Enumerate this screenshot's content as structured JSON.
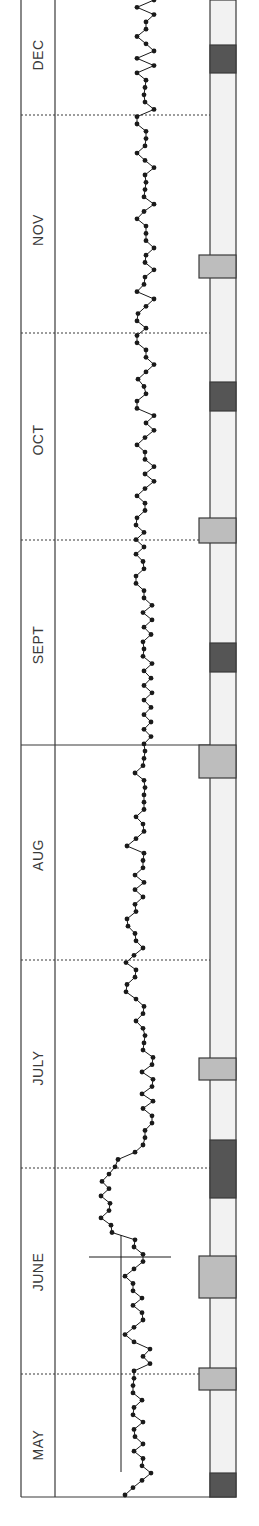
{
  "chart_data": {
    "type": "line",
    "orientation": "rotated-90-ccw",
    "title": "",
    "xlabel": "",
    "ylabel": "",
    "months": [
      {
        "label": "MAY",
        "y_top": 1374,
        "y_bottom": 1497,
        "label_y": 1445
      },
      {
        "label": "JUNE",
        "y_top": 1168,
        "y_bottom": 1374,
        "label_y": 1272
      },
      {
        "label": "JULY",
        "y_top": 960,
        "y_bottom": 1168,
        "label_y": 1068
      },
      {
        "label": "AUG",
        "y_top": 745,
        "y_bottom": 960,
        "label_y": 855
      },
      {
        "label": "SEPT",
        "y_top": 540,
        "y_bottom": 745,
        "label_y": 645
      },
      {
        "label": "OCT",
        "y_top": 333,
        "y_bottom": 540,
        "label_y": 440
      },
      {
        "label": "NOV",
        "y_top": 115,
        "y_bottom": 333,
        "label_y": 230
      },
      {
        "label": "DEC",
        "y_top": 0,
        "y_bottom": 115,
        "label_y": 55
      }
    ],
    "separators": [
      {
        "y": 115,
        "style": "dotted"
      },
      {
        "y": 333,
        "style": "dotted"
      },
      {
        "y": 540,
        "style": "dotted"
      },
      {
        "y": 745,
        "style": "solid"
      },
      {
        "y": 960,
        "style": "dotted"
      },
      {
        "y": 1168,
        "style": "dotted"
      },
      {
        "y": 1374,
        "style": "dotted"
      }
    ],
    "reference_lines": {
      "baseline_vertical": {
        "x": 121,
        "y1": 1235,
        "y2": 1472
      },
      "crossing_horizontal": {
        "y": 1257,
        "x1": 89,
        "x2": 171
      }
    },
    "series": [
      {
        "name": "daily readings",
        "marker": "dot",
        "color": "#1a1a1a",
        "points_bottom_to_top_x": [
          125,
          133,
          142,
          151,
          142,
          143,
          134,
          143,
          135,
          134,
          143,
          133,
          134,
          142,
          133,
          133,
          134,
          134,
          150,
          143,
          150,
          134,
          125,
          134,
          143,
          142,
          133,
          142,
          133,
          133,
          125,
          134,
          143,
          143,
          134,
          135,
          112,
          111,
          101,
          109,
          110,
          101,
          109,
          102,
          109,
          115,
          118,
          135,
          143,
          145,
          145,
          152,
          152,
          143,
          153,
          142,
          152,
          153,
          142,
          152,
          153,
          143,
          144,
          145,
          143,
          136,
          143,
          144,
          136,
          126,
          127,
          135,
          136,
          126,
          134,
          143,
          136,
          135,
          128,
          127,
          136,
          135,
          143,
          135,
          144,
          135,
          143,
          143,
          144,
          127,
          136,
          144,
          143,
          136,
          144,
          144,
          144,
          145,
          144,
          135,
          143,
          144,
          145,
          144,
          151,
          144,
          151,
          144,
          151,
          144,
          152,
          144,
          151,
          144,
          152,
          143,
          144,
          143,
          151,
          144,
          152,
          143,
          152,
          144,
          144,
          136,
          136,
          144,
          143,
          136,
          144,
          136,
          144,
          136,
          137,
          145,
          145,
          137,
          145,
          154,
          145,
          154,
          145,
          145,
          137,
          145,
          154,
          146,
          154,
          137,
          137,
          146,
          144,
          138,
          146,
          154,
          146,
          146,
          137,
          137,
          146,
          137,
          138,
          146,
          154,
          137,
          144,
          145,
          154,
          145,
          146,
          154,
          146,
          146,
          146,
          137,
          144,
          154,
          144,
          145,
          146,
          145,
          154,
          145,
          137,
          145,
          146,
          146,
          137,
          137,
          154,
          145,
          144,
          145,
          146,
          137,
          154,
          137,
          154,
          146,
          137,
          146,
          146,
          154,
          137,
          154
        ]
      }
    ],
    "right_strip": {
      "x_left": 210,
      "x_right": 236,
      "fill": "#f0f0f0",
      "blocks": [
        {
          "y1": 45,
          "y2": 73,
          "shade": "dark",
          "wide": false
        },
        {
          "y1": 255,
          "y2": 278,
          "shade": "light",
          "wide": true
        },
        {
          "y1": 382,
          "y2": 411,
          "shade": "dark",
          "wide": false
        },
        {
          "y1": 518,
          "y2": 543,
          "shade": "light",
          "wide": true
        },
        {
          "y1": 643,
          "y2": 672,
          "shade": "dark",
          "wide": false
        },
        {
          "y1": 745,
          "y2": 778,
          "shade": "light",
          "wide": true
        },
        {
          "y1": 1058,
          "y2": 1080,
          "shade": "light",
          "wide": true
        },
        {
          "y1": 1140,
          "y2": 1198,
          "shade": "dark",
          "wide": false
        },
        {
          "y1": 1256,
          "y2": 1298,
          "shade": "light",
          "wide": true
        },
        {
          "y1": 1368,
          "y2": 1390,
          "shade": "light",
          "wide": true
        },
        {
          "y1": 1473,
          "y2": 1497,
          "shade": "dark",
          "wide": false
        }
      ]
    },
    "colors": {
      "frame": "#3a3a3a",
      "dark_block": "#555555",
      "light_block": "#bdbdbd",
      "strip_fill": "#f2f2f2",
      "line": "#1a1a1a"
    },
    "grid": false,
    "legend": "none"
  }
}
